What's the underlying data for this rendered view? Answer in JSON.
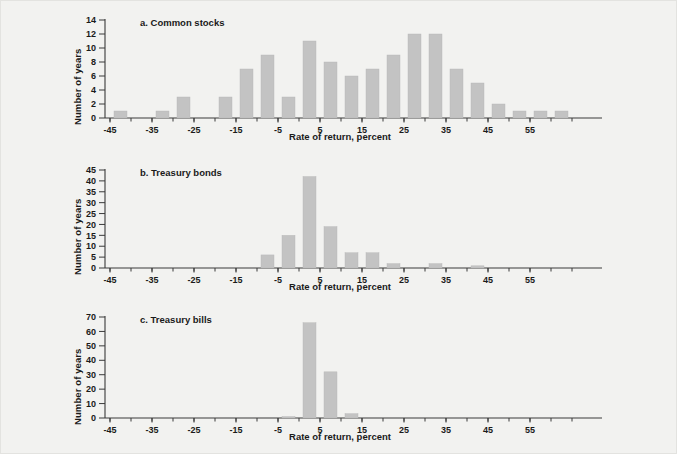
{
  "figure": {
    "background_color": "#f2f2f0",
    "bar_color": "#c3c3c3",
    "axis_color": "#3a3a3a"
  },
  "shared": {
    "ylabel": "Number of years",
    "xlabel": "Rate of return, percent",
    "xticks": [
      "-45",
      "-35",
      "-25",
      "-15",
      "-5",
      "5",
      "15",
      "25",
      "35",
      "45",
      "55"
    ],
    "xtick_values": [
      -45,
      -35,
      -25,
      -15,
      -5,
      5,
      15,
      25,
      35,
      45,
      55
    ],
    "xlim": [
      -47.5,
      67.5
    ],
    "bin_width": 5
  },
  "chart_data": [
    {
      "type": "bar",
      "id": "common-stocks",
      "title": "a. Common stocks",
      "xlabel": "Rate of return, percent",
      "ylabel": "Number of years",
      "ylim": [
        0,
        14
      ],
      "yticks": [
        0,
        2,
        4,
        6,
        8,
        10,
        12,
        14
      ],
      "ytick_labels": [
        "0",
        "2",
        "4",
        "6",
        "8",
        "10",
        "12",
        "14"
      ],
      "xlim": [
        -47.5,
        67.5
      ],
      "xticks": [
        -45,
        -35,
        -25,
        -15,
        -5,
        5,
        15,
        25,
        35,
        45,
        55
      ],
      "xtick_labels": [
        "-45",
        "-35",
        "-25",
        "-15",
        "-5",
        "5",
        "15",
        "25",
        "35",
        "45",
        "55"
      ],
      "grid": false,
      "legend": "none",
      "bin_width": 5,
      "bin_starts": [
        -45,
        -40,
        -35,
        -30,
        -25,
        -20,
        -15,
        -10,
        -5,
        0,
        5,
        10,
        15,
        20,
        25,
        30,
        35,
        40,
        45,
        50,
        55,
        60
      ],
      "categories": [
        "-45 to -40",
        "-40 to -35",
        "-35 to -30",
        "-30 to -25",
        "-25 to -20",
        "-20 to -15",
        "-15 to -10",
        "-10 to -5",
        "-5 to 0",
        "0 to 5",
        "5 to 10",
        "10 to 15",
        "15 to 20",
        "20 to 25",
        "25 to 30",
        "30 to 35",
        "35 to 40",
        "40 to 45",
        "45 to 50",
        "50 to 55",
        "55 to 60",
        "60 to 65"
      ],
      "values": [
        1,
        0,
        1,
        3,
        0,
        3,
        7,
        9,
        3,
        11,
        8,
        6,
        7,
        9,
        12,
        12,
        7,
        5,
        2,
        1,
        1,
        1
      ]
    },
    {
      "type": "bar",
      "id": "treasury-bonds",
      "title": "b. Treasury bonds",
      "xlabel": "Rate of return, percent",
      "ylabel": "Number of years",
      "ylim": [
        0,
        45
      ],
      "yticks": [
        0,
        5,
        10,
        15,
        20,
        25,
        30,
        35,
        40,
        45
      ],
      "ytick_labels": [
        "0",
        "5",
        "10",
        "15",
        "20",
        "25",
        "30",
        "35",
        "40",
        "45"
      ],
      "xlim": [
        -47.5,
        67.5
      ],
      "xticks": [
        -45,
        -35,
        -25,
        -15,
        -5,
        5,
        15,
        25,
        35,
        45,
        55
      ],
      "xtick_labels": [
        "-45",
        "-35",
        "-25",
        "-15",
        "-5",
        "5",
        "15",
        "25",
        "35",
        "45",
        "55"
      ],
      "grid": false,
      "legend": "none",
      "bin_width": 5,
      "bin_starts": [
        -10,
        -5,
        0,
        5,
        10,
        15,
        20,
        30,
        40
      ],
      "categories": [
        "-10 to -5",
        "-5 to 0",
        "0 to 5",
        "5 to 10",
        "10 to 15",
        "15 to 20",
        "20 to 25",
        "30 to 35",
        "40 to 45"
      ],
      "values": [
        6,
        15,
        42,
        19,
        7,
        7,
        2,
        2,
        1
      ]
    },
    {
      "type": "bar",
      "id": "treasury-bills",
      "title": "c. Treasury bills",
      "xlabel": "Rate of return, percent",
      "ylabel": "Number of years",
      "ylim": [
        0,
        70
      ],
      "yticks": [
        0,
        10,
        20,
        30,
        40,
        50,
        60,
        70
      ],
      "ytick_labels": [
        "0",
        "10",
        "20",
        "30",
        "40",
        "50",
        "60",
        "70"
      ],
      "xlim": [
        -47.5,
        67.5
      ],
      "xticks": [
        -45,
        -35,
        -25,
        -15,
        -5,
        5,
        15,
        25,
        35,
        45,
        55
      ],
      "xtick_labels": [
        "-45",
        "-35",
        "-25",
        "-15",
        "-5",
        "5",
        "15",
        "25",
        "35",
        "45",
        "55"
      ],
      "grid": false,
      "legend": "none",
      "bin_width": 5,
      "bin_starts": [
        -5,
        0,
        5,
        10
      ],
      "categories": [
        "-5 to 0",
        "0 to 5",
        "5 to 10",
        "10 to 15"
      ],
      "values": [
        1,
        66,
        32,
        3
      ]
    }
  ]
}
